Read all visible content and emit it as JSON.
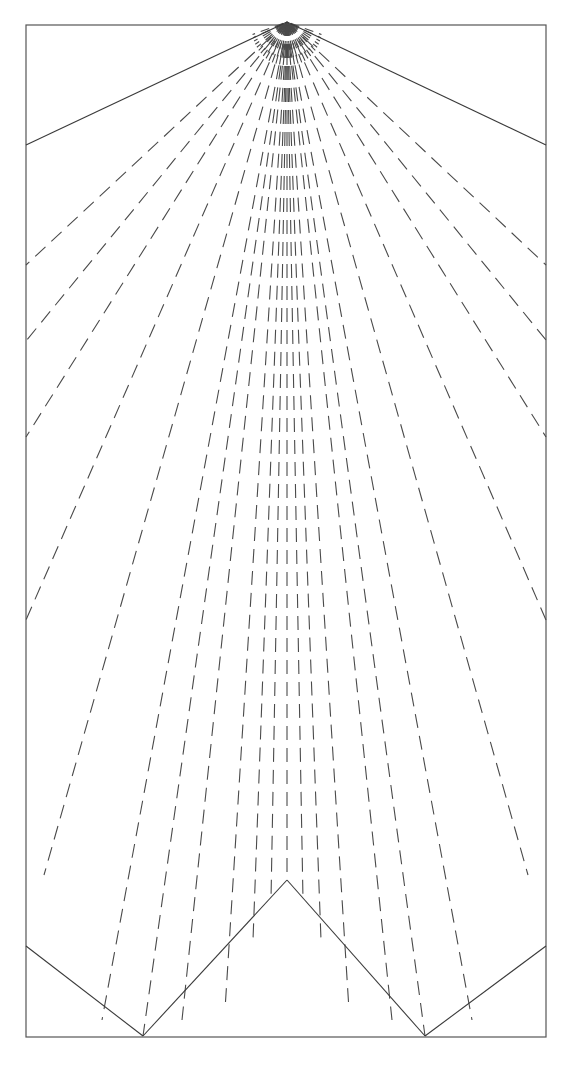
{
  "canvas": {
    "width": 566,
    "height": 1065,
    "background": "#ffffff",
    "title": "Perspective fan line drawing"
  },
  "style": {
    "solid_color": "#3a3a3a",
    "dashed_color": "#4a4a4a",
    "frame_color": "#555555",
    "solid_width": 1.1,
    "dashed_width": 1.1,
    "frame_width": 1.2,
    "dash_pattern": "14 8",
    "dash_pattern_short": "9 6"
  },
  "frame": {
    "label": "outer rectangle border",
    "left": 26,
    "top": 25,
    "right": 546,
    "bottom": 1037
  },
  "apex": {
    "label": "convergence vanishing point",
    "x": 287,
    "y": 22
  },
  "solid_lines": [
    {
      "name": "upper-left-ridge",
      "x1": 287,
      "y1": 22,
      "x2": 26,
      "y2": 145
    },
    {
      "name": "upper-right-ridge",
      "x1": 287,
      "y1": 22,
      "x2": 546,
      "y2": 145
    },
    {
      "name": "lower-zigzag-left-arm",
      "x1": 26,
      "y1": 946,
      "x2": 143,
      "y2": 1036
    },
    {
      "name": "lower-zigzag-left-rise",
      "x1": 143,
      "y1": 1036,
      "x2": 287,
      "y2": 880
    },
    {
      "name": "lower-zigzag-right-fall",
      "x1": 287,
      "y1": 880,
      "x2": 425,
      "y2": 1036
    },
    {
      "name": "lower-zigzag-right-arm",
      "x1": 425,
      "y1": 1036,
      "x2": 546,
      "y2": 946
    }
  ],
  "dashed_rays": [
    {
      "name": "ray-L11",
      "x2": 26,
      "y2": 265
    },
    {
      "name": "ray-L10",
      "x2": 26,
      "y2": 341
    },
    {
      "name": "ray-L9",
      "x2": 26,
      "y2": 437
    },
    {
      "name": "ray-L8",
      "x2": 26,
      "y2": 620
    },
    {
      "name": "ray-L7",
      "x2": 44,
      "y2": 875
    },
    {
      "name": "ray-L6",
      "x2": 102,
      "y2": 1020
    },
    {
      "name": "ray-L5",
      "x2": 143,
      "y2": 1036
    },
    {
      "name": "ray-L4",
      "x2": 182,
      "y2": 1020
    },
    {
      "name": "ray-L3",
      "x2": 225,
      "y2": 1010
    },
    {
      "name": "ray-L2",
      "x2": 253,
      "y2": 940
    },
    {
      "name": "ray-L1",
      "x2": 271,
      "y2": 900
    },
    {
      "name": "ray-C0",
      "x2": 287,
      "y2": 880
    },
    {
      "name": "ray-R1",
      "x2": 303,
      "y2": 900
    },
    {
      "name": "ray-R2",
      "x2": 321,
      "y2": 940
    },
    {
      "name": "ray-R3",
      "x2": 349,
      "y2": 1010
    },
    {
      "name": "ray-R4",
      "x2": 392,
      "y2": 1020
    },
    {
      "name": "ray-R5",
      "x2": 425,
      "y2": 1036
    },
    {
      "name": "ray-R6",
      "x2": 472,
      "y2": 1020
    },
    {
      "name": "ray-R7",
      "x2": 528,
      "y2": 875
    },
    {
      "name": "ray-R8",
      "x2": 546,
      "y2": 620
    },
    {
      "name": "ray-R9",
      "x2": 546,
      "y2": 437
    },
    {
      "name": "ray-R10",
      "x2": 546,
      "y2": 340
    },
    {
      "name": "ray-R11",
      "x2": 546,
      "y2": 265
    }
  ],
  "apex_tuft": {
    "label": "dense short strokes radiating from apex",
    "count": 29,
    "inner_radius": 4,
    "outer_radius": 46,
    "angle_start_deg": 200,
    "angle_end_deg": 340
  }
}
